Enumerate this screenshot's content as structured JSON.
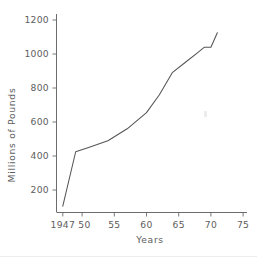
{
  "chart_data": {
    "type": "line",
    "title": "",
    "subtitle": "",
    "xlabel": "Years",
    "ylabel": "Millions of Pounds",
    "xlim": [
      1946,
      1976
    ],
    "ylim": [
      0,
      1280
    ],
    "grid": false,
    "legend": null,
    "x_ticks": [
      {
        "value": 1947,
        "label": "1947"
      },
      {
        "value": 1950,
        "label": "50"
      },
      {
        "value": 1955,
        "label": "55"
      },
      {
        "value": 1960,
        "label": "60"
      },
      {
        "value": 1965,
        "label": "65"
      },
      {
        "value": 1970,
        "label": "70"
      },
      {
        "value": 1975,
        "label": "75"
      }
    ],
    "y_ticks": [
      {
        "value": 200,
        "label": "200"
      },
      {
        "value": 400,
        "label": "400"
      },
      {
        "value": 600,
        "label": "600"
      },
      {
        "value": 800,
        "label": "800"
      },
      {
        "value": 1000,
        "label": "1000"
      },
      {
        "value": 1200,
        "label": "1200"
      }
    ],
    "series": [
      {
        "name": "Millions of Pounds",
        "x": [
          1947,
          1949,
          1951,
          1954,
          1957,
          1960,
          1962,
          1964,
          1966,
          1968,
          1969,
          1970,
          1971
        ],
        "values": [
          105,
          425,
          450,
          490,
          560,
          655,
          760,
          890,
          950,
          1010,
          1040,
          1040,
          1125
        ]
      }
    ],
    "annotations": []
  },
  "axis_labels": {
    "x_title": "Years",
    "y_title": "Millions of Pounds"
  }
}
